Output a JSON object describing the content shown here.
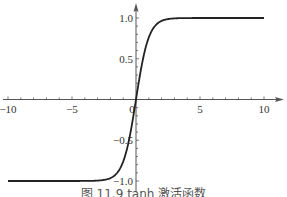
{
  "chart_data": {
    "type": "line",
    "title": "",
    "caption": "图 11.9 tanh 激活函数",
    "xlabel": "",
    "ylabel": "",
    "xlim": [
      -10,
      10
    ],
    "ylim": [
      -1.0,
      1.0
    ],
    "grid": false,
    "legend": null,
    "x_ticks": [
      -10,
      -5,
      0,
      5,
      10
    ],
    "x_tick_labels": [
      "−10",
      "−5",
      "0",
      "5",
      "10"
    ],
    "y_ticks": [
      -1.0,
      -0.5,
      0.5,
      1.0
    ],
    "y_tick_labels": [
      "−1.0",
      "−0.5",
      "0.5",
      "1.0"
    ],
    "series": [
      {
        "name": "tanh(x)",
        "function": "tanh",
        "x": [
          -10,
          -8,
          -6,
          -4,
          -3,
          -2,
          -1.5,
          -1,
          -0.5,
          0,
          0.5,
          1,
          1.5,
          2,
          3,
          4,
          6,
          8,
          10
        ],
        "values": [
          -1.0,
          -1.0,
          -1.0,
          -0.999,
          -0.995,
          -0.964,
          -0.905,
          -0.762,
          -0.462,
          0.0,
          0.462,
          0.762,
          0.905,
          0.964,
          0.995,
          0.999,
          1.0,
          1.0,
          1.0
        ]
      }
    ],
    "colors": {
      "curve": "#222222",
      "axis": "#555555"
    }
  }
}
